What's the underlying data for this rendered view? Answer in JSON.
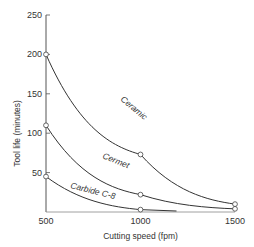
{
  "chart_data": {
    "type": "line",
    "title": "",
    "xlabel": "Cutting speed (fpm)",
    "ylabel": "Tool life (minutes)",
    "x_ticks": [
      "500",
      "1000",
      "1500"
    ],
    "y_ticks": [
      "50",
      "100",
      "150",
      "200",
      "250"
    ],
    "xlim": [
      500,
      1500
    ],
    "ylim": [
      0,
      250
    ],
    "grid": false,
    "legend": "inline labels on curves",
    "series": [
      {
        "name": "Ceramic",
        "x": [
          500,
          1000,
          1500
        ],
        "values": [
          200,
          73,
          10
        ]
      },
      {
        "name": "Cermet",
        "x": [
          500,
          1000,
          1500
        ],
        "values": [
          110,
          22,
          4
        ]
      },
      {
        "name": "Carbide C-8",
        "x": [
          500,
          1000
        ],
        "values": [
          45,
          3
        ]
      }
    ]
  }
}
